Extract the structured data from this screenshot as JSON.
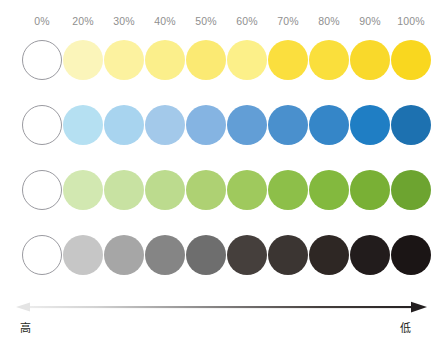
{
  "chart_data": {
    "type": "heatmap",
    "title": "",
    "xlabel": "",
    "ylabel": "",
    "grid": false,
    "legend_position": "bottom",
    "categories": [
      "0%",
      "20%",
      "30%",
      "40%",
      "50%",
      "60%",
      "70%",
      "80%",
      "90%",
      "100%"
    ],
    "x": [
      0,
      20,
      30,
      40,
      50,
      60,
      70,
      80,
      90,
      100
    ],
    "series": [
      {
        "name": "yellow",
        "values": [
          0,
          20,
          30,
          40,
          50,
          60,
          70,
          80,
          90,
          100
        ],
        "colors": [
          "#ffffff",
          "#fbf5ba",
          "#fcf29f",
          "#fbef8b",
          "#fbea73",
          "#fcf089",
          "#fbdf3e",
          "#fadf3c",
          "#f9d92b",
          "#f9d71f"
        ]
      },
      {
        "name": "blue",
        "values": [
          0,
          20,
          30,
          40,
          50,
          60,
          70,
          80,
          90,
          100
        ],
        "colors": [
          "#ffffff",
          "#b5e0f2",
          "#a8d4ef",
          "#a3c9ea",
          "#85b4e2",
          "#629ed6",
          "#4a90cd",
          "#3586c8",
          "#1f7ec4",
          "#1d71b0"
        ]
      },
      {
        "name": "green",
        "values": [
          0,
          20,
          30,
          40,
          50,
          60,
          70,
          80,
          90,
          100
        ],
        "colors": [
          "#ffffff",
          "#d2e8b1",
          "#c8e2a2",
          "#bcdb8e",
          "#aed173",
          "#9fc95d",
          "#8dbf49",
          "#83b93e",
          "#79b035",
          "#6da430"
        ]
      },
      {
        "name": "grayscale",
        "values": [
          0,
          20,
          30,
          40,
          50,
          60,
          70,
          80,
          90,
          100
        ],
        "colors": [
          "#ffffff",
          "#c6c6c6",
          "#a6a6a6",
          "#858585",
          "#6e6e6e",
          "#453f3c",
          "#3b3532",
          "#2e2724",
          "#221c1c",
          "#1b1515"
        ]
      }
    ],
    "axis_arrow": {
      "left_label": "高",
      "right_label": "低",
      "left_meaning": "high",
      "right_meaning": "low",
      "double_headed": true,
      "gradient_from": "#e8e8e8",
      "gradient_to": "#231f20"
    }
  },
  "ticks": [
    {
      "label": "0%",
      "left": 22
    },
    {
      "label": "20%",
      "left": 63
    },
    {
      "label": "30%",
      "left": 104
    },
    {
      "label": "40%",
      "left": 145
    },
    {
      "label": "50%",
      "left": 186
    },
    {
      "label": "60%",
      "left": 227
    },
    {
      "label": "70%",
      "left": 268
    },
    {
      "label": "80%",
      "left": 309
    },
    {
      "label": "90%",
      "left": 350
    },
    {
      "label": "100%",
      "left": 391
    }
  ],
  "rows": [
    {
      "name": "yellow-row",
      "top": 40
    },
    {
      "name": "blue-row",
      "top": 105
    },
    {
      "name": "green-row",
      "top": 170
    },
    {
      "name": "grayscale-row",
      "top": 235
    }
  ],
  "columns_left": [
    22,
    63,
    104,
    145,
    186,
    227,
    268,
    309,
    350,
    391
  ]
}
